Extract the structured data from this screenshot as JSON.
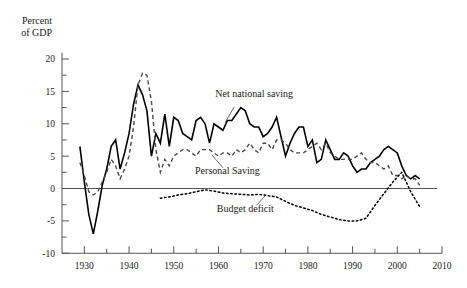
{
  "chart_data": {
    "type": "line",
    "title": "",
    "ylabel_line1": "Percent",
    "ylabel_line2": "of GDP",
    "xlabel": "",
    "xlim": [
      1925,
      2010
    ],
    "ylim": [
      -10,
      21
    ],
    "grid": false,
    "legend_position": "inline-annotations",
    "y_ticks": [
      20,
      15,
      10,
      5,
      0,
      -5,
      -10
    ],
    "y_tick_labels": [
      "20",
      "15",
      "10",
      "5",
      "0",
      "-5",
      "-10"
    ],
    "y_minor_ticks": [
      17.5,
      12.5,
      7.5,
      2.5,
      -2.5,
      -7.5
    ],
    "x_ticks": [
      1930,
      1940,
      1950,
      1960,
      1970,
      1980,
      1990,
      2000,
      2010
    ],
    "x_tick_labels": [
      "1930",
      "1940",
      "1950",
      "1960",
      "1970",
      "1980",
      "1990",
      "2000",
      "2010"
    ],
    "x_minor_ticks": [
      1935,
      1945,
      1955,
      1965,
      1975,
      1985,
      1995,
      2005
    ],
    "series": [
      {
        "name": "Net national saving",
        "style": "solid",
        "color": "#000000",
        "label_x": 1968,
        "label_y": 14.2,
        "x": [
          1929,
          1930,
          1931,
          1932,
          1933,
          1934,
          1935,
          1936,
          1937,
          1938,
          1939,
          1940,
          1941,
          1942,
          1943,
          1944,
          1945,
          1946,
          1947,
          1948,
          1949,
          1950,
          1951,
          1952,
          1953,
          1954,
          1955,
          1956,
          1957,
          1958,
          1959,
          1960,
          1961,
          1962,
          1963,
          1964,
          1965,
          1966,
          1967,
          1968,
          1969,
          1970,
          1971,
          1972,
          1973,
          1974,
          1975,
          1976,
          1977,
          1978,
          1979,
          1980,
          1981,
          1982,
          1983,
          1984,
          1985,
          1986,
          1987,
          1988,
          1989,
          1990,
          1991,
          1992,
          1993,
          1994,
          1995,
          1996,
          1997,
          1998,
          1999,
          2000,
          2001,
          2002,
          2003,
          2004,
          2005
        ],
        "values": [
          6.5,
          1.0,
          -4.0,
          -7.0,
          -3.5,
          0.5,
          3.0,
          6.5,
          7.5,
          3.0,
          5.5,
          8.5,
          13.0,
          16.0,
          14.5,
          12.0,
          5.0,
          8.5,
          7.0,
          11.5,
          6.5,
          11.0,
          10.5,
          8.5,
          8.0,
          7.5,
          10.5,
          11.0,
          10.0,
          7.0,
          10.0,
          9.5,
          9.0,
          10.5,
          10.5,
          11.5,
          12.5,
          12.0,
          10.0,
          9.5,
          9.5,
          8.0,
          8.5,
          9.5,
          11.0,
          8.0,
          5.0,
          7.0,
          8.5,
          9.5,
          9.5,
          6.5,
          7.5,
          4.0,
          4.5,
          7.5,
          6.0,
          4.5,
          4.5,
          5.5,
          5.0,
          3.5,
          2.5,
          3.0,
          3.0,
          4.0,
          4.5,
          5.0,
          6.0,
          6.5,
          6.0,
          5.5,
          3.5,
          2.0,
          1.5,
          2.0,
          1.5
        ]
      },
      {
        "name": "Personal Saving",
        "style": "dashed",
        "color": "#4a4a4a",
        "label_x": 1962,
        "label_y": 2.2,
        "x": [
          1929,
          1930,
          1931,
          1932,
          1933,
          1934,
          1935,
          1936,
          1937,
          1938,
          1939,
          1940,
          1941,
          1942,
          1943,
          1944,
          1945,
          1946,
          1947,
          1948,
          1949,
          1950,
          1951,
          1952,
          1953,
          1954,
          1955,
          1956,
          1957,
          1958,
          1959,
          1960,
          1961,
          1962,
          1963,
          1964,
          1965,
          1966,
          1967,
          1968,
          1969,
          1970,
          1971,
          1972,
          1973,
          1974,
          1975,
          1976,
          1977,
          1978,
          1979,
          1980,
          1981,
          1982,
          1983,
          1984,
          1985,
          1986,
          1987,
          1988,
          1989,
          1990,
          1991,
          1992,
          1993,
          1994,
          1995,
          1996,
          1997,
          1998,
          1999,
          2000,
          2001,
          2002,
          2003,
          2004,
          2005
        ],
        "values": [
          4.0,
          2.0,
          -0.5,
          -1.0,
          -0.5,
          1.0,
          2.5,
          4.5,
          3.5,
          1.5,
          3.0,
          5.0,
          9.5,
          16.0,
          17.8,
          17.5,
          13.5,
          6.0,
          2.5,
          4.5,
          3.5,
          5.0,
          5.5,
          6.0,
          6.0,
          5.5,
          5.0,
          6.0,
          6.0,
          6.0,
          5.5,
          5.0,
          5.5,
          5.5,
          5.0,
          6.0,
          5.5,
          6.0,
          7.0,
          6.0,
          5.5,
          7.0,
          7.0,
          6.0,
          7.5,
          7.5,
          7.0,
          6.0,
          5.5,
          5.5,
          5.5,
          6.0,
          6.5,
          7.0,
          6.0,
          7.0,
          5.5,
          5.0,
          4.5,
          4.5,
          4.5,
          4.5,
          5.0,
          5.5,
          4.5,
          4.0,
          4.0,
          3.5,
          3.0,
          3.5,
          2.0,
          2.0,
          1.5,
          2.0,
          1.5,
          1.5,
          0.5
        ]
      },
      {
        "name": "Budget deficit",
        "style": "dotted",
        "color": "#000000",
        "label_x": 1966,
        "label_y": -3.6,
        "x": [
          1947,
          1949,
          1951,
          1953,
          1955,
          1957,
          1959,
          1961,
          1963,
          1965,
          1967,
          1969,
          1971,
          1973,
          1975,
          1977,
          1979,
          1981,
          1983,
          1985,
          1987,
          1989,
          1991,
          1993,
          1995,
          1997,
          1999,
          2001,
          2003,
          2005
        ],
        "values": [
          -1.5,
          -1.3,
          -1.0,
          -0.8,
          -0.5,
          -0.2,
          -0.4,
          -0.7,
          -0.8,
          -0.9,
          -1.0,
          -0.9,
          -1.1,
          -1.3,
          -2.0,
          -2.6,
          -3.0,
          -3.4,
          -4.0,
          -4.4,
          -4.8,
          -5.0,
          -5.0,
          -4.6,
          -2.6,
          -0.8,
          1.0,
          2.5,
          -0.5,
          -2.8
        ]
      }
    ]
  }
}
